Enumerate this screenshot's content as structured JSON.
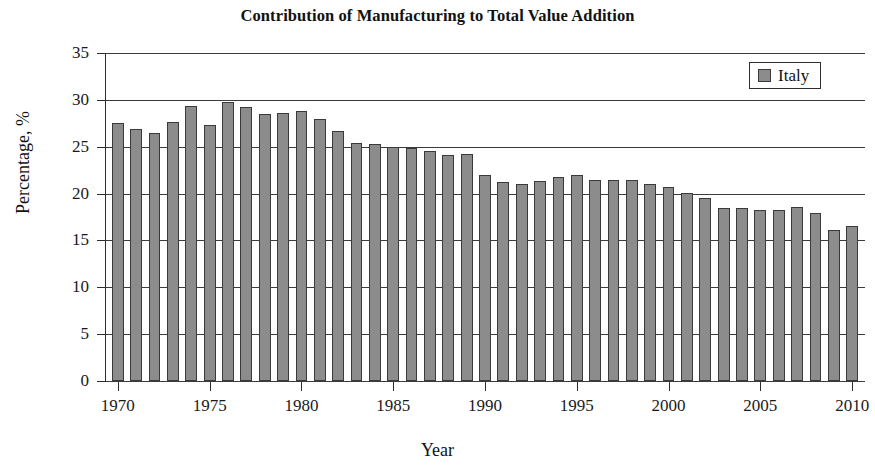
{
  "chart_data": {
    "type": "bar",
    "title": "Contribution of Manufacturing to Total Value Addition",
    "xlabel": "Year",
    "ylabel": "Percentage, %",
    "ylim": [
      0,
      35
    ],
    "ytick_values": [
      0,
      5,
      10,
      15,
      20,
      25,
      30,
      35
    ],
    "ytick_labels": [
      "0",
      "5",
      "10",
      "15",
      "20",
      "25",
      "30",
      "35"
    ],
    "xlim": [
      1969.3,
      2010.7
    ],
    "xtick_values": [
      1970,
      1975,
      1980,
      1985,
      1990,
      1995,
      2000,
      2005,
      2010
    ],
    "xtick_labels": [
      "1970",
      "1975",
      "1980",
      "1985",
      "1990",
      "1995",
      "2000",
      "2005",
      "2010"
    ],
    "grid": "horizontal",
    "legend_position": "top-right",
    "bar_color": "#8c8c8c",
    "bar_edge_color": "#3a3a3a",
    "series": [
      {
        "name": "Italy",
        "x": [
          1970,
          1971,
          1972,
          1973,
          1974,
          1975,
          1976,
          1977,
          1978,
          1979,
          1980,
          1981,
          1982,
          1983,
          1984,
          1985,
          1986,
          1987,
          1988,
          1989,
          1990,
          1991,
          1992,
          1993,
          1994,
          1995,
          1996,
          1997,
          1998,
          1999,
          2000,
          2001,
          2002,
          2003,
          2004,
          2005,
          2006,
          2007,
          2008,
          2009,
          2010
        ],
        "values": [
          27.5,
          26.9,
          26.5,
          27.6,
          29.3,
          27.3,
          29.8,
          29.2,
          28.5,
          28.6,
          28.8,
          28.0,
          26.7,
          25.4,
          25.3,
          25.0,
          24.9,
          24.5,
          24.1,
          24.2,
          22.0,
          21.2,
          21.0,
          21.3,
          21.8,
          22.0,
          21.4,
          21.5,
          21.5,
          21.0,
          20.7,
          20.1,
          19.5,
          18.5,
          18.5,
          18.2,
          18.2,
          18.6,
          17.9,
          16.1,
          16.5
        ]
      }
    ]
  },
  "legend": {
    "entries": [
      {
        "label": "Italy",
        "color": "#8c8c8c"
      }
    ]
  }
}
